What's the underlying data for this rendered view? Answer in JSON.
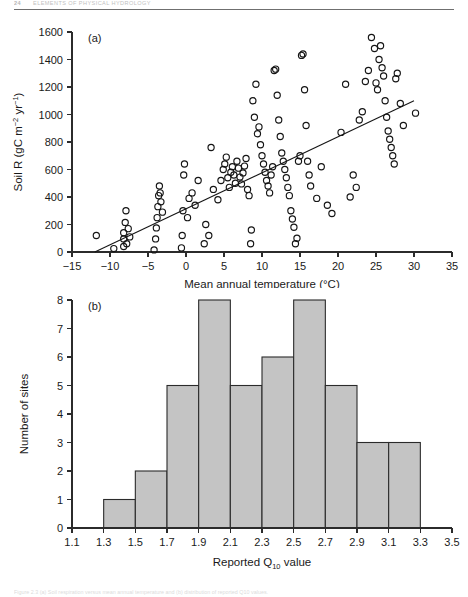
{
  "page": {
    "folio": "24",
    "running_head": "ELEMENTS OF PHYSICAL HYDROLOGY",
    "figure_caption": "Figure 2.3  (a) Soil respiration versus mean annual temperature and (b) distribution of reported Q10 values."
  },
  "chart_data": [
    {
      "type": "scatter",
      "panel_label": "(a)",
      "title": "",
      "xlabel": "Mean annual temperature (°C)",
      "ylabel": "Soil R (gC m⁻² yr⁻¹)",
      "ylabel_parts": {
        "prefix": "Soil R (gC m",
        "sup1": "−2",
        "mid": " yr",
        "sup2": "−1",
        "suffix": ")"
      },
      "xlim": [
        -15,
        35
      ],
      "ylim": [
        0,
        1600
      ],
      "xticks": [
        -15,
        -10,
        -5,
        0,
        5,
        10,
        15,
        20,
        25,
        30,
        35
      ],
      "xtick_labels": [
        "−15",
        "−10",
        "−5",
        "0",
        "5",
        "10",
        "15",
        "20",
        "25",
        "30",
        "35"
      ],
      "yticks": [
        0,
        200,
        400,
        600,
        800,
        1000,
        1200,
        1400,
        1600
      ],
      "ytick_labels": [
        "0",
        "200",
        "400",
        "600",
        "800",
        "1000",
        "1200",
        "1400",
        "1600"
      ],
      "grid": false,
      "legend": "none",
      "marker": "open-circle",
      "points": [
        [
          -11.8,
          120
        ],
        [
          -9.5,
          25
        ],
        [
          -8.2,
          40
        ],
        [
          -8.2,
          95
        ],
        [
          -8.2,
          140
        ],
        [
          -8.0,
          215
        ],
        [
          -7.9,
          300
        ],
        [
          -7.8,
          60
        ],
        [
          -7.6,
          170
        ],
        [
          -7.4,
          110
        ],
        [
          -4.2,
          15
        ],
        [
          -4.0,
          95
        ],
        [
          -3.9,
          175
        ],
        [
          -3.8,
          250
        ],
        [
          -3.7,
          330
        ],
        [
          -3.6,
          410
        ],
        [
          -3.5,
          480
        ],
        [
          -3.4,
          430
        ],
        [
          -3.3,
          365
        ],
        [
          -3.1,
          290
        ],
        [
          -0.6,
          30
        ],
        [
          -0.5,
          120
        ],
        [
          -0.4,
          300
        ],
        [
          -0.3,
          560
        ],
        [
          -0.2,
          640
        ],
        [
          0.2,
          250
        ],
        [
          0.4,
          390
        ],
        [
          0.8,
          430
        ],
        [
          1.2,
          340
        ],
        [
          1.6,
          520
        ],
        [
          2.4,
          60
        ],
        [
          2.6,
          200
        ],
        [
          3.0,
          120
        ],
        [
          3.3,
          760
        ],
        [
          3.6,
          455
        ],
        [
          4.2,
          380
        ],
        [
          4.6,
          520
        ],
        [
          4.9,
          600
        ],
        [
          5.1,
          640
        ],
        [
          5.3,
          690
        ],
        [
          5.5,
          540
        ],
        [
          5.7,
          470
        ],
        [
          5.9,
          580
        ],
        [
          6.1,
          620
        ],
        [
          6.3,
          560
        ],
        [
          6.5,
          500
        ],
        [
          6.7,
          660
        ],
        [
          6.9,
          610
        ],
        [
          7.1,
          545
        ],
        [
          7.3,
          495
        ],
        [
          7.5,
          575
        ],
        [
          7.7,
          625
        ],
        [
          7.9,
          680
        ],
        [
          8.1,
          455
        ],
        [
          8.3,
          410
        ],
        [
          8.5,
          60
        ],
        [
          8.6,
          160
        ],
        [
          8.8,
          1100
        ],
        [
          9.0,
          980
        ],
        [
          9.2,
          1220
        ],
        [
          9.4,
          860
        ],
        [
          9.6,
          910
        ],
        [
          9.8,
          780
        ],
        [
          10.0,
          700
        ],
        [
          10.2,
          640
        ],
        [
          10.4,
          580
        ],
        [
          10.6,
          520
        ],
        [
          10.8,
          480
        ],
        [
          11.0,
          430
        ],
        [
          11.2,
          560
        ],
        [
          11.4,
          620
        ],
        [
          11.6,
          1320
        ],
        [
          11.8,
          1330
        ],
        [
          12.0,
          1140
        ],
        [
          12.2,
          960
        ],
        [
          12.4,
          840
        ],
        [
          12.6,
          720
        ],
        [
          12.8,
          660
        ],
        [
          13.0,
          600
        ],
        [
          13.2,
          540
        ],
        [
          13.4,
          470
        ],
        [
          13.6,
          410
        ],
        [
          13.8,
          300
        ],
        [
          14.0,
          240
        ],
        [
          14.2,
          180
        ],
        [
          14.4,
          60
        ],
        [
          14.6,
          100
        ],
        [
          14.8,
          660
        ],
        [
          15.0,
          700
        ],
        [
          15.2,
          1430
        ],
        [
          15.4,
          1440
        ],
        [
          15.6,
          1180
        ],
        [
          15.8,
          920
        ],
        [
          16.0,
          660
        ],
        [
          16.2,
          560
        ],
        [
          16.4,
          480
        ],
        [
          17.2,
          390
        ],
        [
          17.8,
          620
        ],
        [
          18.6,
          340
        ],
        [
          19.2,
          280
        ],
        [
          20.4,
          870
        ],
        [
          21.0,
          1220
        ],
        [
          21.6,
          400
        ],
        [
          22.0,
          560
        ],
        [
          22.4,
          470
        ],
        [
          22.8,
          960
        ],
        [
          23.2,
          1020
        ],
        [
          23.6,
          1240
        ],
        [
          24.0,
          1320
        ],
        [
          24.4,
          1560
        ],
        [
          24.8,
          1480
        ],
        [
          25.0,
          1230
        ],
        [
          25.2,
          1180
        ],
        [
          25.4,
          1400
        ],
        [
          25.6,
          1500
        ],
        [
          25.8,
          1340
        ],
        [
          26.0,
          1280
        ],
        [
          26.2,
          1100
        ],
        [
          26.4,
          980
        ],
        [
          26.6,
          880
        ],
        [
          26.8,
          820
        ],
        [
          27.0,
          760
        ],
        [
          27.2,
          700
        ],
        [
          27.4,
          640
        ],
        [
          27.6,
          1260
        ],
        [
          27.8,
          1300
        ],
        [
          28.2,
          1080
        ],
        [
          28.6,
          920
        ],
        [
          30.2,
          1010
        ]
      ],
      "fit_line": {
        "x0": -12.0,
        "y0": 0,
        "x1": 30.0,
        "y1": 1100
      }
    },
    {
      "type": "bar",
      "panel_label": "(b)",
      "title": "",
      "xlabel": "Reported Q10 value",
      "xlabel_parts": {
        "prefix": "Reported Q",
        "sub": "10",
        "suffix": " value"
      },
      "ylabel": "Number of sites",
      "xlim": [
        1.1,
        3.5
      ],
      "ylim": [
        0,
        8
      ],
      "xticks": [
        1.1,
        1.3,
        1.5,
        1.7,
        1.9,
        2.1,
        2.3,
        2.5,
        2.7,
        2.9,
        3.1,
        3.3,
        3.5
      ],
      "xtick_labels": [
        "1.1",
        "1.3",
        "1.5",
        "1.7",
        "1.9",
        "2.1",
        "2.3",
        "2.5",
        "2.7",
        "2.9",
        "3.1",
        "3.3",
        "3.5"
      ],
      "yticks": [
        0,
        1,
        2,
        3,
        4,
        5,
        6,
        7,
        8
      ],
      "ytick_labels": [
        "0",
        "1",
        "2",
        "3",
        "4",
        "5",
        "6",
        "7",
        "8"
      ],
      "grid": false,
      "legend": "none",
      "bin_width": 0.2,
      "bin_starts": [
        1.3,
        1.5,
        1.7,
        1.9,
        2.1,
        2.3,
        2.5,
        2.7,
        2.9,
        3.1
      ],
      "bin_labels": [
        "1.3–1.5",
        "1.5–1.7",
        "1.7–1.9",
        "1.9–2.1",
        "2.1–2.3",
        "2.3–2.5",
        "2.5–2.7",
        "2.7–2.9",
        "2.9–3.1",
        "3.1–3.3"
      ],
      "values": [
        1,
        2,
        5,
        8,
        5,
        6,
        8,
        5,
        3,
        3
      ],
      "bar_fill": "#c4c4c4",
      "bar_stroke": "#2b2b2b"
    }
  ]
}
